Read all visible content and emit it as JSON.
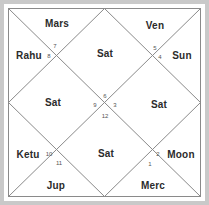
{
  "chart": {
    "kind": "north-indian-vedic-birth-chart",
    "title": "",
    "style": {
      "frame_color": "#c9c9c9",
      "line_color": "#8a8a8a",
      "background": "#ffffff",
      "label_color": "#2b2b2b",
      "number_color": "#555555"
    },
    "geometry": {
      "width": 209,
      "height": 205,
      "inset": 8
    },
    "houses": [
      {
        "number": "1",
        "planets": "Merc",
        "label_x": 153,
        "label_y": 186,
        "num_x": 150,
        "num_y": 164
      },
      {
        "number": "2",
        "planets": "Moon",
        "label_x": 181,
        "label_y": 155,
        "num_x": 158,
        "num_y": 154
      },
      {
        "number": "3",
        "planets": "Sat",
        "label_x": 159,
        "label_y": 105,
        "num_x": 115,
        "num_y": 105
      },
      {
        "number": "4",
        "planets": "Sun",
        "label_x": 182,
        "label_y": 56,
        "num_x": 160,
        "num_y": 57
      },
      {
        "number": "5",
        "planets": "Ven",
        "label_x": 155,
        "label_y": 26,
        "num_x": 155,
        "num_y": 48
      },
      {
        "number": "6",
        "planets": "Sat",
        "label_x": 105,
        "label_y": 54,
        "num_x": 105,
        "num_y": 96
      },
      {
        "number": "7",
        "planets": "Mars",
        "label_x": 57,
        "label_y": 24,
        "num_x": 55,
        "num_y": 46
      },
      {
        "number": "8",
        "planets": "Rahu",
        "label_x": 29,
        "label_y": 56,
        "num_x": 49,
        "num_y": 56
      },
      {
        "number": "9",
        "planets": "Sat",
        "label_x": 53,
        "label_y": 103,
        "num_x": 95,
        "num_y": 105
      },
      {
        "number": "10",
        "planets": "Ketu",
        "label_x": 28,
        "label_y": 155,
        "num_x": 49,
        "num_y": 154
      },
      {
        "number": "11",
        "planets": "Jup",
        "label_x": 56,
        "label_y": 186,
        "num_x": 59,
        "num_y": 163
      },
      {
        "number": "12",
        "planets": "Sat",
        "label_x": 106,
        "label_y": 154,
        "num_x": 105,
        "num_y": 116
      }
    ]
  }
}
